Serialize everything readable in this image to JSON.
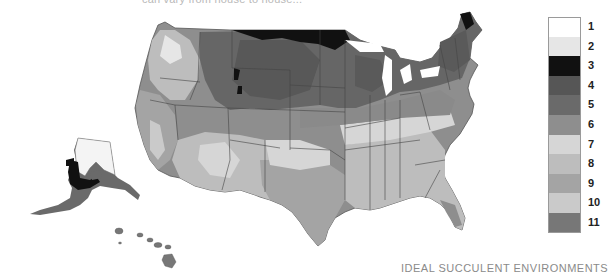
{
  "caption_top": "can vary from house to house...",
  "footer_title": "IDEAL SUCCULENT ENVIRONMENTS",
  "legend": {
    "items": [
      {
        "label": "1",
        "color": "#ffffff"
      },
      {
        "label": "2",
        "color": "#e6e6e6"
      },
      {
        "label": "3",
        "color": "#111111"
      },
      {
        "label": "4",
        "color": "#565656"
      },
      {
        "label": "5",
        "color": "#6a6a6a"
      },
      {
        "label": "6",
        "color": "#8e8e8e"
      },
      {
        "label": "7",
        "color": "#d6d6d6"
      },
      {
        "label": "8",
        "color": "#bdbdbd"
      },
      {
        "label": "9",
        "color": "#a4a4a4"
      },
      {
        "label": "10",
        "color": "#cacaca"
      },
      {
        "label": "11",
        "color": "#777777"
      }
    ]
  },
  "map": {
    "subject": "United States hardiness zone map (grayscale), incl. Alaska and Hawaii insets"
  }
}
